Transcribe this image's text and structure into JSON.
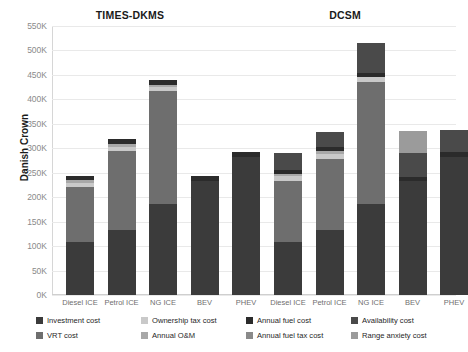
{
  "chart_data": {
    "type": "bar",
    "title": "",
    "subtitle": "",
    "xlabel": "",
    "ylabel": "Danish Crown",
    "ylim": [
      0,
      550000
    ],
    "ytick_labels": [
      "0K",
      "50K",
      "100K",
      "150K",
      "200K",
      "250K",
      "300K",
      "350K",
      "400K",
      "450K",
      "500K",
      "550K"
    ],
    "ytick_values": [
      0,
      50000,
      100000,
      150000,
      200000,
      250000,
      300000,
      350000,
      400000,
      450000,
      500000,
      550000
    ],
    "grid": true,
    "stacked": true,
    "legend_position": "bottom",
    "group_titles": [
      "TIMES-DKMS",
      "DCSM"
    ],
    "categories": [
      "Diesel ICE",
      "Petrol ICE",
      "NG ICE",
      "BEV",
      "PHEV"
    ],
    "series": [
      {
        "name": "Investment cost",
        "color": "#3b3b3b"
      },
      {
        "name": "Ownership tax cost",
        "color": "#c9c9c9"
      },
      {
        "name": "Annual fuel cost",
        "color": "#2b2b2b"
      },
      {
        "name": "Availability cost",
        "color": "#4a4a4a"
      },
      {
        "name": "VRT cost",
        "color": "#6e6e6e"
      },
      {
        "name": "Annual O&M",
        "color": "#a8a8a8"
      },
      {
        "name": "Annual fuel tax cost",
        "color": "#8a8a8a"
      },
      {
        "name": "Range anxiety cost",
        "color": "#9b9b9b"
      }
    ],
    "groups": [
      {
        "name": "TIMES-DKMS",
        "bars": [
          {
            "category": "Diesel ICE",
            "total": 243000,
            "segments": [
              {
                "series": "Investment cost",
                "value": 108000
              },
              {
                "series": "VRT cost",
                "value": 112000
              },
              {
                "series": "Ownership tax cost",
                "value": 10000
              },
              {
                "series": "Annual O&M",
                "value": 5000
              },
              {
                "series": "Annual fuel cost",
                "value": 8000
              }
            ]
          },
          {
            "category": "Petrol ICE",
            "total": 318000,
            "segments": [
              {
                "series": "Investment cost",
                "value": 132000
              },
              {
                "series": "VRT cost",
                "value": 162000
              },
              {
                "series": "Ownership tax cost",
                "value": 9000
              },
              {
                "series": "Annual O&M",
                "value": 5000
              },
              {
                "series": "Annual fuel cost",
                "value": 10000
              }
            ]
          },
          {
            "category": "NG ICE",
            "total": 440000,
            "segments": [
              {
                "series": "Investment cost",
                "value": 186000
              },
              {
                "series": "VRT cost",
                "value": 232000
              },
              {
                "series": "Ownership tax cost",
                "value": 8000
              },
              {
                "series": "Annual O&M",
                "value": 4000
              },
              {
                "series": "Annual fuel cost",
                "value": 10000
              }
            ]
          },
          {
            "category": "BEV",
            "total": 243000,
            "segments": [
              {
                "series": "Investment cost",
                "value": 234000
              },
              {
                "series": "Annual fuel cost",
                "value": 9000
              }
            ]
          },
          {
            "category": "PHEV",
            "total": 292000,
            "segments": [
              {
                "series": "Investment cost",
                "value": 283000
              },
              {
                "series": "Annual fuel cost",
                "value": 9000
              }
            ]
          }
        ]
      },
      {
        "name": "DCSM",
        "bars": [
          {
            "category": "Diesel ICE",
            "total": 290000,
            "segments": [
              {
                "series": "Investment cost",
                "value": 108000
              },
              {
                "series": "VRT cost",
                "value": 125000
              },
              {
                "series": "Ownership tax cost",
                "value": 10000
              },
              {
                "series": "Annual O&M",
                "value": 5000
              },
              {
                "series": "Annual fuel cost",
                "value": 8000
              },
              {
                "series": "Availability cost",
                "value": 34000
              }
            ]
          },
          {
            "category": "Petrol ICE",
            "total": 334000,
            "segments": [
              {
                "series": "Investment cost",
                "value": 132000
              },
              {
                "series": "VRT cost",
                "value": 146000
              },
              {
                "series": "Ownership tax cost",
                "value": 11000
              },
              {
                "series": "Annual O&M",
                "value": 5000
              },
              {
                "series": "Annual fuel cost",
                "value": 9000
              },
              {
                "series": "Availability cost",
                "value": 31000
              }
            ]
          },
          {
            "category": "NG ICE",
            "total": 516000,
            "segments": [
              {
                "series": "Investment cost",
                "value": 186000
              },
              {
                "series": "VRT cost",
                "value": 250000
              },
              {
                "series": "Ownership tax cost",
                "value": 9000
              },
              {
                "series": "Annual fuel cost",
                "value": 8000
              },
              {
                "series": "Availability cost",
                "value": 63000
              }
            ]
          },
          {
            "category": "BEV",
            "total": 335000,
            "segments": [
              {
                "series": "Investment cost",
                "value": 234000
              },
              {
                "series": "Annual fuel cost",
                "value": 8000
              },
              {
                "series": "Availability cost",
                "value": 48000
              },
              {
                "series": "Range anxiety cost",
                "value": 45000
              }
            ]
          },
          {
            "category": "PHEV",
            "total": 337000,
            "segments": [
              {
                "series": "Investment cost",
                "value": 283000
              },
              {
                "series": "Annual fuel cost",
                "value": 9000
              },
              {
                "series": "Availability cost",
                "value": 45000
              }
            ]
          }
        ]
      }
    ],
    "legend": [
      {
        "label": "Investment cost",
        "color": "#3b3b3b"
      },
      {
        "label": "Ownership tax cost",
        "color": "#c9c9c9"
      },
      {
        "label": "Annual fuel cost",
        "color": "#2b2b2b"
      },
      {
        "label": "Availability cost",
        "color": "#4a4a4a"
      },
      {
        "label": "VRT cost",
        "color": "#6e6e6e"
      },
      {
        "label": "Annual O&M",
        "color": "#a8a8a8"
      },
      {
        "label": "Annual fuel tax cost",
        "color": "#8a8a8a"
      },
      {
        "label": "Range anxiety cost",
        "color": "#9b9b9b"
      }
    ]
  }
}
